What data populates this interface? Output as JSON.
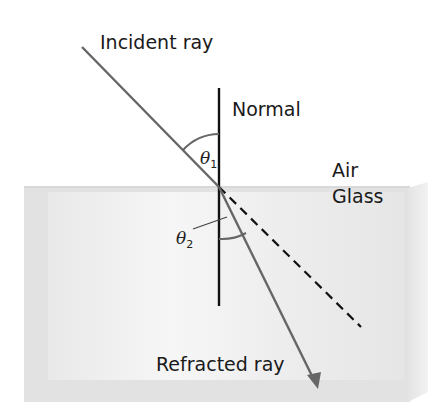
{
  "diagram": {
    "labels": {
      "incident_ray": "Incident ray",
      "normal": "Normal",
      "air": "Air",
      "glass": "Glass",
      "refracted_ray": "Refracted ray"
    },
    "angles": {
      "theta1": {
        "symbol": "θ",
        "subscript": "1"
      },
      "theta2": {
        "symbol": "θ",
        "subscript": "2"
      }
    },
    "colors": {
      "ray": "#666666",
      "normal": "#111111",
      "glass_face": "#eeeeee",
      "glass_edge": "#dcdcdc",
      "text": "#1a1a1a"
    }
  }
}
